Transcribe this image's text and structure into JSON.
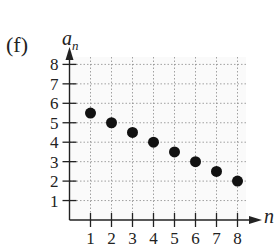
{
  "figure": {
    "panel_label": "(f)",
    "ylabel_base": "a",
    "ylabel_sub": "n",
    "xlabel": "n"
  },
  "chart_data": {
    "type": "scatter",
    "title": "",
    "panel_label": "(f)",
    "xlabel": "n",
    "ylabel": "a_n",
    "x": [
      1,
      2,
      3,
      4,
      5,
      6,
      7,
      8
    ],
    "y": [
      5.5,
      5,
      4.5,
      4,
      3.5,
      3,
      2.5,
      2
    ],
    "xticks": [
      1,
      2,
      3,
      4,
      5,
      6,
      7,
      8
    ],
    "yticks": [
      1,
      2,
      3,
      4,
      5,
      6,
      7,
      8
    ],
    "xlim": [
      0,
      8.6
    ],
    "ylim": [
      0,
      8.6
    ],
    "grid": true,
    "grid_style": "dotted",
    "legend": null,
    "marker": "filled-circle",
    "marker_color": "#111111"
  }
}
